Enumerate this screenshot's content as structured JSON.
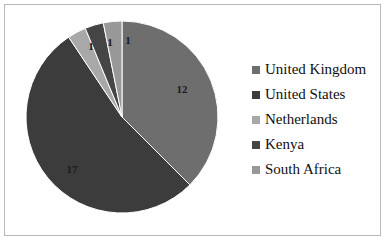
{
  "chart_data": {
    "type": "pie",
    "title": "",
    "categories": [
      "United Kingdom",
      "United States",
      "Netherlands",
      "Kenya",
      "South Africa"
    ],
    "values": [
      12,
      17,
      1,
      1,
      1
    ],
    "total": 32,
    "data_labels": [
      "12",
      "17",
      "1",
      "1",
      "1"
    ],
    "colors": [
      "#6e6e6e",
      "#3c3c3c",
      "#a8a8a8",
      "#454545",
      "#989898"
    ],
    "start_angle_deg": 0,
    "direction": "clockwise",
    "legend_position": "right",
    "grid": false,
    "xlabel": "",
    "ylabel": ""
  },
  "legend": {
    "items": [
      {
        "label": "United Kingdom",
        "color": "#6e6e6e"
      },
      {
        "label": "United States",
        "color": "#3c3c3c"
      },
      {
        "label": "Netherlands",
        "color": "#a8a8a8"
      },
      {
        "label": "Kenya",
        "color": "#454545"
      },
      {
        "label": "South Africa",
        "color": "#989898"
      }
    ]
  },
  "labels": {
    "uk": "12",
    "us": "17",
    "netherlands": "1",
    "kenya": "1",
    "south_africa": "1"
  },
  "frame": {
    "border_color": "#b9b9b9",
    "background": "#ffffff"
  }
}
